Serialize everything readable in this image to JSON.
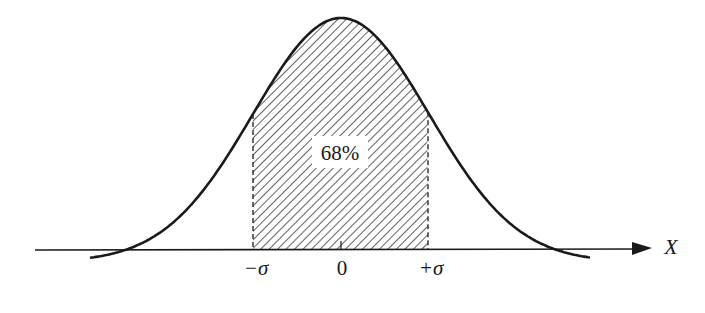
{
  "diagram": {
    "area_label": "68%",
    "axis_label": "X",
    "ticks": [
      {
        "label": "−σ",
        "x": 253
      },
      {
        "label": "0",
        "x": 341
      },
      {
        "label": "+σ",
        "x": 428
      }
    ],
    "colors": {
      "stroke": "#1a1a1a",
      "hatch": "#3a3a3a",
      "background": "#ffffff"
    },
    "curve": {
      "mean_x": 341,
      "peak_y": 18,
      "baseline_y": 250,
      "sigma_px": 88,
      "x_start": 90,
      "x_end": 591
    }
  }
}
